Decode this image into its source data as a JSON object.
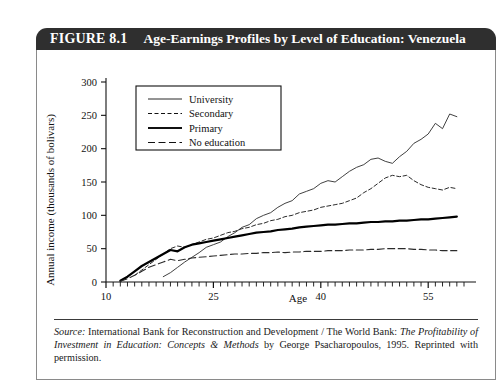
{
  "figure": {
    "label": "FIGURE 8.1",
    "title": "Age-Earnings Profiles by Level of Education: Venezuela"
  },
  "source": {
    "prefix": "Source:",
    "line1": " International Bank for Reconstruction and Development / The World Bank: ",
    "italic1": "The Profitability of Investment in Education: Concepts & Methods",
    "line2": " by George Psacharopoulos, 1995. Reprinted with permission."
  },
  "chart_data": {
    "type": "line",
    "title": "Age-Earnings Profiles by Level of Education: Venezuela",
    "xlabel": "Age",
    "ylabel": "Annual income (thousands of bolivars)",
    "xlim": [
      10,
      60
    ],
    "ylim": [
      0,
      300
    ],
    "xticks": [
      10,
      25,
      40,
      55
    ],
    "yticks": [
      0,
      50,
      100,
      150,
      200,
      250,
      300
    ],
    "xminor_step": 1,
    "grid": false,
    "legend_position": "top-left-inside",
    "series": [
      {
        "name": "University",
        "style": "thin-solid",
        "color": "#2b2b2b",
        "x": [
          18,
          19,
          20,
          21,
          22,
          23,
          24,
          25,
          26,
          27,
          28,
          29,
          30,
          31,
          32,
          33,
          34,
          35,
          36,
          37,
          38,
          39,
          40,
          41,
          42,
          43,
          44,
          45,
          46,
          47,
          48,
          49,
          50,
          51,
          52,
          53,
          54,
          55,
          56,
          57,
          58,
          59
        ],
        "values": [
          8,
          14,
          22,
          30,
          37,
          44,
          52,
          56,
          60,
          68,
          74,
          82,
          86,
          95,
          100,
          104,
          112,
          118,
          122,
          132,
          136,
          140,
          148,
          152,
          150,
          158,
          166,
          172,
          176,
          184,
          186,
          181,
          178,
          188,
          196,
          208,
          214,
          222,
          238,
          230,
          252,
          248
        ]
      },
      {
        "name": "Secondary",
        "style": "short-dash",
        "color": "#2b2b2b",
        "x": [
          14,
          15,
          16,
          17,
          18,
          19,
          20,
          21,
          22,
          23,
          24,
          25,
          26,
          27,
          28,
          29,
          30,
          31,
          32,
          33,
          34,
          35,
          36,
          37,
          38,
          39,
          40,
          41,
          42,
          43,
          44,
          45,
          46,
          47,
          48,
          49,
          50,
          51,
          52,
          53,
          54,
          55,
          56,
          57,
          58,
          59
        ],
        "values": [
          10,
          18,
          26,
          34,
          42,
          50,
          54,
          52,
          56,
          60,
          64,
          66,
          70,
          74,
          76,
          80,
          82,
          86,
          88,
          92,
          94,
          98,
          100,
          104,
          106,
          108,
          112,
          114,
          116,
          118,
          122,
          126,
          134,
          140,
          148,
          156,
          160,
          158,
          160,
          152,
          146,
          142,
          140,
          138,
          142,
          140
        ]
      },
      {
        "name": "Primary",
        "style": "thick-solid",
        "color": "#000000",
        "x": [
          12,
          13,
          14,
          15,
          16,
          17,
          18,
          19,
          20,
          21,
          22,
          23,
          24,
          25,
          26,
          27,
          28,
          29,
          30,
          31,
          32,
          33,
          34,
          35,
          36,
          37,
          38,
          39,
          40,
          41,
          42,
          43,
          44,
          45,
          46,
          47,
          48,
          49,
          50,
          51,
          52,
          53,
          54,
          55,
          56,
          57,
          58,
          59
        ],
        "values": [
          2,
          8,
          16,
          24,
          30,
          36,
          42,
          48,
          46,
          52,
          56,
          58,
          60,
          62,
          64,
          66,
          68,
          70,
          72,
          74,
          75,
          76,
          78,
          79,
          80,
          82,
          83,
          84,
          85,
          86,
          86,
          87,
          88,
          88,
          89,
          90,
          90,
          91,
          91,
          92,
          92,
          93,
          94,
          94,
          95,
          96,
          97,
          98
        ]
      },
      {
        "name": "No education",
        "style": "long-dash",
        "color": "#2b2b2b",
        "x": [
          12,
          13,
          14,
          15,
          16,
          17,
          18,
          19,
          20,
          21,
          22,
          23,
          24,
          25,
          26,
          27,
          28,
          29,
          30,
          31,
          32,
          33,
          34,
          35,
          36,
          37,
          38,
          39,
          40,
          41,
          42,
          43,
          44,
          45,
          46,
          47,
          48,
          49,
          50,
          51,
          52,
          53,
          54,
          55,
          56,
          57,
          58,
          59
        ],
        "values": [
          1,
          5,
          10,
          16,
          22,
          26,
          30,
          34,
          32,
          34,
          36,
          37,
          38,
          39,
          40,
          41,
          42,
          42,
          43,
          43,
          44,
          44,
          45,
          44,
          45,
          45,
          46,
          46,
          46,
          47,
          47,
          47,
          48,
          48,
          48,
          49,
          49,
          50,
          50,
          50,
          50,
          49,
          49,
          48,
          48,
          47,
          47,
          47
        ]
      }
    ],
    "legend": [
      {
        "label": "University",
        "style": "thin-solid"
      },
      {
        "label": "Secondary",
        "style": "short-dash"
      },
      {
        "label": "Primary",
        "style": "thick-solid"
      },
      {
        "label": "No education",
        "style": "long-dash"
      }
    ]
  }
}
